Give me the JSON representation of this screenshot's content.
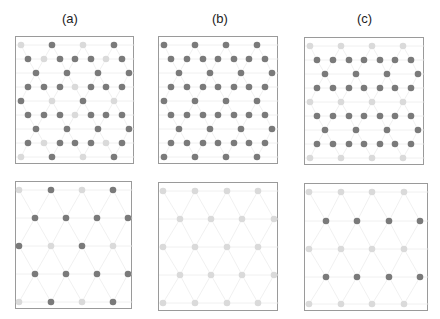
{
  "figure": {
    "labels": [
      {
        "text": "(a)",
        "x": 62,
        "y": 12
      },
      {
        "text": "(b)",
        "x": 212,
        "y": 12
      },
      {
        "text": "(c)",
        "x": 357,
        "y": 12
      }
    ],
    "colors": {
      "dark_dot": "#7a7a7a",
      "light_dot": "#dadada",
      "lattice_line": "#ececec",
      "border": "#9a9a9a"
    },
    "panels": [
      {
        "id": "a-top",
        "column": "(a)",
        "row": "top",
        "box": {
          "x": 15,
          "y": 36,
          "w": 119,
          "h": 128
        },
        "rows": [
          {
            "y": 8,
            "xs": [
              5,
              36,
              67,
              98
            ],
            "states": "LDLD"
          },
          {
            "y": 22,
            "xs": [
              12,
              28,
              44,
              59,
              75,
              90,
              106
            ],
            "states": "DLDDDLD"
          },
          {
            "y": 36,
            "xs": [
              20,
              51,
              82,
              113
            ],
            "states": "DDDD"
          },
          {
            "y": 50,
            "xs": [
              12,
              28,
              44,
              59,
              75,
              90,
              106
            ],
            "states": "DDDLDDD"
          },
          {
            "y": 64,
            "xs": [
              5,
              36,
              67,
              98
            ],
            "states": "DLDL"
          },
          {
            "y": 78,
            "xs": [
              12,
              28,
              44,
              59,
              75,
              90,
              106
            ],
            "states": "DDDLDDD"
          },
          {
            "y": 92,
            "xs": [
              20,
              51,
              82,
              113
            ],
            "states": "DDDD"
          },
          {
            "y": 106,
            "xs": [
              12,
              28,
              44,
              59,
              75,
              90,
              106
            ],
            "states": "DLDDDLD"
          },
          {
            "y": 120,
            "xs": [
              5,
              36,
              67,
              98
            ],
            "states": "LDLD"
          }
        ]
      },
      {
        "id": "b-top",
        "column": "(b)",
        "row": "top",
        "box": {
          "x": 158,
          "y": 36,
          "w": 120,
          "h": 128
        },
        "rows": [
          {
            "y": 8,
            "xs": [
              5,
              36,
              67,
              98
            ],
            "states": "DDDD"
          },
          {
            "y": 22,
            "xs": [
              12,
              28,
              44,
              59,
              75,
              90,
              106
            ],
            "states": "DDDDDDD"
          },
          {
            "y": 36,
            "xs": [
              20,
              51,
              82,
              113
            ],
            "states": "DDDD"
          },
          {
            "y": 50,
            "xs": [
              12,
              28,
              44,
              59,
              75,
              90,
              106
            ],
            "states": "DDDDDDD"
          },
          {
            "y": 64,
            "xs": [
              5,
              36,
              67,
              98
            ],
            "states": "DDDD"
          },
          {
            "y": 78,
            "xs": [
              12,
              28,
              44,
              59,
              75,
              90,
              106
            ],
            "states": "DDDDDDD"
          },
          {
            "y": 92,
            "xs": [
              20,
              51,
              82,
              113
            ],
            "states": "DDDD"
          },
          {
            "y": 106,
            "xs": [
              12,
              28,
              44,
              59,
              75,
              90,
              106
            ],
            "states": "DDDDDDD"
          },
          {
            "y": 120,
            "xs": [
              5,
              36,
              67,
              98
            ],
            "states": "DDDD"
          }
        ]
      },
      {
        "id": "c-top",
        "column": "(c)",
        "row": "top",
        "box": {
          "x": 304,
          "y": 37,
          "w": 120,
          "h": 128
        },
        "rows": [
          {
            "y": 8,
            "xs": [
              5,
              36,
              67,
              98
            ],
            "states": "LLLL"
          },
          {
            "y": 22,
            "xs": [
              12,
              28,
              44,
              59,
              75,
              90,
              106
            ],
            "states": "DDDDDDD"
          },
          {
            "y": 36,
            "xs": [
              20,
              51,
              82,
              113
            ],
            "states": "DDDD"
          },
          {
            "y": 50,
            "xs": [
              12,
              28,
              44,
              59,
              75,
              90,
              106
            ],
            "states": "DDDDDDD"
          },
          {
            "y": 64,
            "xs": [
              5,
              36,
              67,
              98
            ],
            "states": "LLLL"
          },
          {
            "y": 78,
            "xs": [
              12,
              28,
              44,
              59,
              75,
              90,
              106
            ],
            "states": "DDDDDDD"
          },
          {
            "y": 92,
            "xs": [
              20,
              51,
              82,
              113
            ],
            "states": "DDDD"
          },
          {
            "y": 106,
            "xs": [
              12,
              28,
              44,
              59,
              75,
              90,
              106
            ],
            "states": "DDDDDDD"
          },
          {
            "y": 120,
            "xs": [
              5,
              36,
              67,
              98
            ],
            "states": "LLLL"
          }
        ]
      },
      {
        "id": "a-bottom",
        "column": "(a)",
        "row": "bottom",
        "box": {
          "x": 15,
          "y": 181,
          "w": 117,
          "h": 128
        },
        "rows": [
          {
            "y": 8,
            "xs": [
              3,
              35,
              66,
              97
            ],
            "states": "LDLD"
          },
          {
            "y": 36,
            "xs": [
              19,
              50,
              81,
              112
            ],
            "states": "DDDD"
          },
          {
            "y": 64,
            "xs": [
              3,
              35,
              66,
              97
            ],
            "states": "DLDL"
          },
          {
            "y": 92,
            "xs": [
              19,
              50,
              81,
              112
            ],
            "states": "DDDD"
          },
          {
            "y": 120,
            "xs": [
              3,
              35,
              66,
              97
            ],
            "states": "LDLD"
          }
        ]
      },
      {
        "id": "b-bottom",
        "column": "(b)",
        "row": "bottom",
        "box": {
          "x": 158,
          "y": 182,
          "w": 120,
          "h": 129
        },
        "rows": [
          {
            "y": 8,
            "xs": [
              4,
              36,
              68,
              99
            ],
            "states": "LLLL"
          },
          {
            "y": 36,
            "xs": [
              21,
              52,
              83,
              115
            ],
            "states": "LLLL"
          },
          {
            "y": 64,
            "xs": [
              4,
              36,
              68,
              99
            ],
            "states": "LLLL"
          },
          {
            "y": 92,
            "xs": [
              21,
              52,
              83,
              115
            ],
            "states": "LLLL"
          },
          {
            "y": 120,
            "xs": [
              4,
              36,
              68,
              99
            ],
            "states": "LLLL"
          }
        ]
      },
      {
        "id": "c-bottom",
        "column": "(c)",
        "row": "bottom",
        "box": {
          "x": 304,
          "y": 183,
          "w": 124,
          "h": 128
        },
        "rows": [
          {
            "y": 8,
            "xs": [
              4,
              36,
              67,
              99
            ],
            "states": "LLLL"
          },
          {
            "y": 37,
            "xs": [
              21,
              52,
              84,
              115
            ],
            "states": "DDDD"
          },
          {
            "y": 65,
            "xs": [
              4,
              36,
              67,
              99
            ],
            "states": "LLLL"
          },
          {
            "y": 93,
            "xs": [
              21,
              52,
              84,
              115
            ],
            "states": "DDDD"
          },
          {
            "y": 120,
            "xs": [
              4,
              36,
              67,
              99
            ],
            "states": "LLLL"
          }
        ]
      }
    ]
  }
}
